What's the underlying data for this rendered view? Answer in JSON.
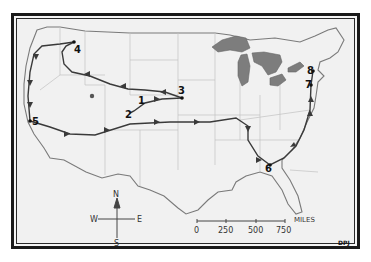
{
  "map": {
    "type": "hand-drawn route map",
    "region": "Contiguous United States",
    "colors": {
      "paper": "#f1f1f1",
      "frame": "#1a1a1a",
      "outline": "#7a7a7a",
      "state_lines": "#bdbdbd",
      "route": "#3a3a3a",
      "lakes": "#7d7d7d"
    },
    "stops": [
      {
        "label": "1",
        "x": 140,
        "y": 100
      },
      {
        "label": "2",
        "x": 130,
        "y": 113
      },
      {
        "label": "3",
        "x": 182,
        "y": 98
      },
      {
        "label": "4",
        "x": 74,
        "y": 42
      },
      {
        "label": "5",
        "x": 30,
        "y": 121
      },
      {
        "label": "6",
        "x": 270,
        "y": 165
      },
      {
        "label": "7",
        "x": 311,
        "y": 85
      },
      {
        "label": "8",
        "x": 313,
        "y": 71
      }
    ],
    "compass": {
      "n": "N",
      "s": "S",
      "e": "E",
      "w": "W"
    },
    "scale": {
      "ticks": [
        "0",
        "250",
        "500",
        "750"
      ],
      "unit": "MILES"
    },
    "signature": "DPJ"
  }
}
